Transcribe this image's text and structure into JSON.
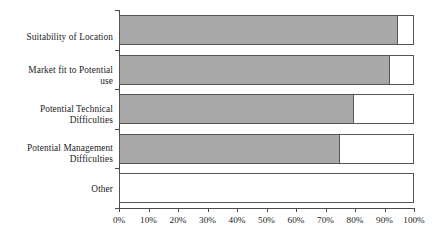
{
  "chart_data": {
    "type": "bar",
    "orientation": "horizontal",
    "stacked": true,
    "title": "",
    "subtitle": "",
    "xlabel": "",
    "ylabel": "",
    "categories": [
      "Suitability of Location",
      "Market fit to Potential use",
      "Potential Technical Difficulties",
      "Potential Management Difficulties",
      "Other"
    ],
    "category_lines": [
      [
        "Suitability of Location"
      ],
      [
        "Market fit to Potential",
        "use"
      ],
      [
        "Potential Technical",
        "Difficulties"
      ],
      [
        "Potential Management",
        "Difficulties"
      ],
      [
        "Other"
      ]
    ],
    "series": [
      {
        "name": "Filled",
        "color": "#a9a9a9",
        "values": [
          95,
          92,
          80,
          75,
          0
        ]
      },
      {
        "name": "Remainder",
        "color": "#ffffff",
        "values": [
          5,
          8,
          20,
          25,
          100
        ]
      }
    ],
    "values": [
      95,
      92,
      80,
      75,
      0
    ],
    "xlim": [
      0,
      100
    ],
    "xticks": [
      0,
      10,
      20,
      30,
      40,
      50,
      60,
      70,
      80,
      90,
      100
    ],
    "xtick_labels": [
      "0%",
      "10%",
      "20%",
      "30%",
      "40%",
      "50%",
      "60%",
      "70%",
      "80%",
      "90%",
      "100%"
    ],
    "grid": false,
    "legend": false,
    "legend_position": "none",
    "background_color": "#ffffff",
    "axis_color": "#4a4a4a",
    "bar_border_color": "#555555",
    "bar_fill_color": "#a9a9a9"
  }
}
